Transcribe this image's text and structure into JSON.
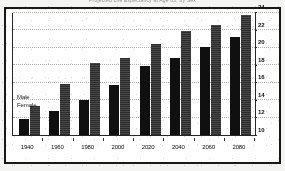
{
  "chart_data": {
    "type": "bar",
    "title": "Projected Life Expectancy at Age 65, by Sex",
    "xlabel": "",
    "ylabel": "",
    "categories": [
      "1940",
      "1960",
      "1980",
      "2000",
      "2020",
      "2040",
      "2060",
      "2080"
    ],
    "series": [
      {
        "name": "Male",
        "values": [
          11.8,
          12.7,
          14.0,
          15.7,
          17.9,
          18.8,
          20.1,
          21.2
        ]
      },
      {
        "name": "Female",
        "values": [
          13.3,
          15.8,
          18.3,
          18.8,
          20.5,
          21.9,
          22.6,
          23.8
        ]
      }
    ],
    "ylim": [
      10,
      24
    ],
    "yticks": [
      10,
      12,
      14,
      16,
      18,
      20,
      22,
      24
    ],
    "ytick_labels": [
      "10",
      "12",
      "14",
      "16",
      "18",
      "20",
      "22",
      "24"
    ],
    "grid": true,
    "grid_axis": "y",
    "legend_position": "inside-left",
    "y_axis_position": "right",
    "colors": {
      "male": "#121212",
      "female": "#3a3a3a",
      "frame": "#1a1a1a",
      "grid": "#adadad",
      "background": "#fefefe"
    }
  },
  "legend": {
    "items": [
      {
        "label": "Male"
      },
      {
        "label": "Female"
      }
    ]
  }
}
